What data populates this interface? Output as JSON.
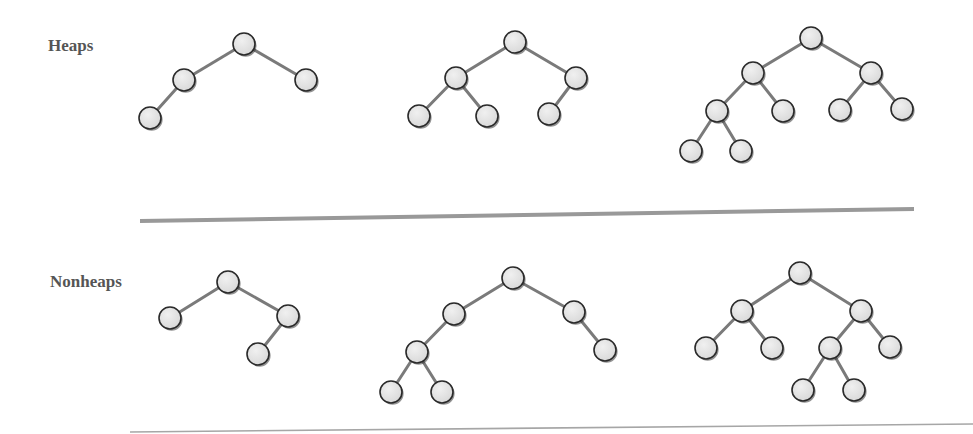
{
  "sections": {
    "heaps": {
      "label": "Heaps"
    },
    "nonheaps": {
      "label": "Nonheaps"
    }
  },
  "style": {
    "node_fill": "#e4e4e4",
    "node_stroke": "#2a2a2a",
    "edge_color": "#7a7a7a",
    "divider_color": "#999999",
    "label_color": "#555555",
    "node_radius": 11
  },
  "trees": [
    {
      "id": "heap-1",
      "section": "heaps",
      "nodes": [
        [
          244,
          44
        ],
        [
          184,
          80
        ],
        [
          306,
          80
        ],
        [
          150,
          118
        ]
      ],
      "edges": [
        [
          0,
          1
        ],
        [
          0,
          2
        ],
        [
          1,
          3
        ]
      ]
    },
    {
      "id": "heap-2",
      "section": "heaps",
      "nodes": [
        [
          515,
          42
        ],
        [
          456,
          78
        ],
        [
          576,
          78
        ],
        [
          419,
          116
        ],
        [
          487,
          116
        ],
        [
          549,
          114
        ]
      ],
      "edges": [
        [
          0,
          1
        ],
        [
          0,
          2
        ],
        [
          1,
          3
        ],
        [
          1,
          4
        ],
        [
          2,
          5
        ]
      ]
    },
    {
      "id": "heap-3",
      "section": "heaps",
      "nodes": [
        [
          811,
          38
        ],
        [
          753,
          73
        ],
        [
          871,
          73
        ],
        [
          717,
          111
        ],
        [
          783,
          111
        ],
        [
          840,
          110
        ],
        [
          902,
          109
        ],
        [
          691,
          151
        ],
        [
          741,
          151
        ]
      ],
      "edges": [
        [
          0,
          1
        ],
        [
          0,
          2
        ],
        [
          1,
          3
        ],
        [
          1,
          4
        ],
        [
          2,
          5
        ],
        [
          2,
          6
        ],
        [
          3,
          7
        ],
        [
          3,
          8
        ]
      ]
    },
    {
      "id": "nonheap-1",
      "section": "nonheaps",
      "nodes": [
        [
          228,
          282
        ],
        [
          170,
          318
        ],
        [
          288,
          316
        ],
        [
          258,
          354
        ]
      ],
      "edges": [
        [
          0,
          1
        ],
        [
          0,
          2
        ],
        [
          2,
          3
        ]
      ]
    },
    {
      "id": "nonheap-2",
      "section": "nonheaps",
      "nodes": [
        [
          513,
          278
        ],
        [
          454,
          314
        ],
        [
          574,
          312
        ],
        [
          417,
          352
        ],
        [
          391,
          392
        ],
        [
          442,
          392
        ],
        [
          605,
          350
        ]
      ],
      "edges": [
        [
          0,
          1
        ],
        [
          0,
          2
        ],
        [
          1,
          3
        ],
        [
          3,
          4
        ],
        [
          3,
          5
        ],
        [
          2,
          6
        ]
      ]
    },
    {
      "id": "nonheap-3",
      "section": "nonheaps",
      "nodes": [
        [
          800,
          273
        ],
        [
          742,
          311
        ],
        [
          861,
          311
        ],
        [
          706,
          348
        ],
        [
          772,
          348
        ],
        [
          830,
          348
        ],
        [
          890,
          347
        ],
        [
          803,
          390
        ],
        [
          854,
          390
        ]
      ],
      "edges": [
        [
          0,
          1
        ],
        [
          0,
          2
        ],
        [
          1,
          3
        ],
        [
          1,
          4
        ],
        [
          2,
          5
        ],
        [
          2,
          6
        ],
        [
          5,
          7
        ],
        [
          5,
          8
        ]
      ]
    }
  ]
}
